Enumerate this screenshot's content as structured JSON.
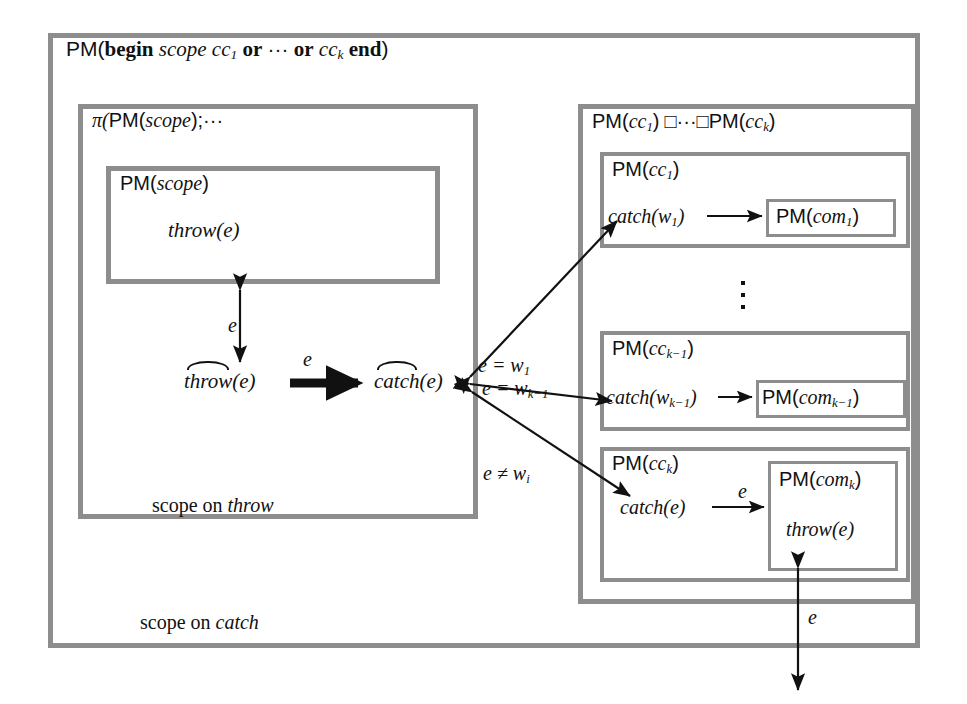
{
  "figure": {
    "kind": "nested-box process-algebra diagram",
    "title_outer": "PM(begin scope cc_1 or ... or cc_k end)",
    "colors": {
      "box_border": "#8d8d8d",
      "arrow": "#111111",
      "background": "#ffffff"
    }
  },
  "outer": {
    "label_prefix": "PM(",
    "label_begin": "begin",
    "label_scope": "scope",
    "label_cc1": "cc",
    "label_cc1_sub": "1",
    "label_or1": "or",
    "label_dots": "···",
    "label_or2": "or",
    "label_cck": "cc",
    "label_cck_sub": "k",
    "label_end": "end",
    "label_suffix": ")",
    "footer": "scope on ",
    "footer_em": "catch"
  },
  "left_panel": {
    "title_pi": "π(",
    "title_pm": "PM(",
    "title_scope": "scope",
    "title_tail": ");···",
    "footer": "scope on ",
    "footer_em": "throw",
    "inner_box": {
      "title_pm": "PM(",
      "title_scope": "scope",
      "title_close": ")",
      "body_fn": "throw",
      "body_arg": "(e)"
    },
    "hat_throw": {
      "fn": "throw",
      "arg": "(e)"
    },
    "hat_catch": {
      "fn": "catch",
      "arg": "(e)"
    }
  },
  "right_panel": {
    "title_pm1": "PM(",
    "title_cc1": "cc",
    "title_cc1_sub": "1",
    "title_box_op": "□",
    "title_dots": "···",
    "title_box_op2": "□",
    "title_pm2": "PM(",
    "title_cck": "cc",
    "title_cck_sub": "k",
    "title_close": ")",
    "vertical_ellipsis": "⋮",
    "clauses": [
      {
        "header_pm": "PM(",
        "header_cc": "cc",
        "header_sub": "1",
        "header_close": ")",
        "catch_fn": "catch",
        "catch_open": "(w",
        "catch_sub": "1",
        "catch_close": ")",
        "target_pm": "PM(",
        "target_com": "com",
        "target_sub": "1",
        "target_close": ")",
        "edge_label": ""
      },
      {
        "header_pm": "PM(",
        "header_cc": "cc",
        "header_sub": "k−1",
        "header_close": ")",
        "catch_fn": "catch",
        "catch_open": "(w",
        "catch_sub": "k−1",
        "catch_close": ")",
        "target_pm": "PM(",
        "target_com": "com",
        "target_sub": "k−1",
        "target_close": ")",
        "edge_label": ""
      },
      {
        "header_pm": "PM(",
        "header_cc": "cc",
        "header_sub": "k",
        "header_close": ")",
        "catch_fn": "catch",
        "catch_open": "(e",
        "catch_sub": "",
        "catch_close": ")",
        "target_pm": "PM(",
        "target_com": "com",
        "target_sub": "k",
        "target_close": ")",
        "edge_label": "e",
        "target_body_fn": "throw",
        "target_body_arg": "(e)"
      }
    ]
  },
  "edge_labels": {
    "e_vertical_left": "e",
    "e_bold_center": "e",
    "e_eq_w1": "e = w",
    "e_eq_w1_sub": "1",
    "e_eq_wk1": "e = w",
    "e_eq_wk1_sub": "k−1",
    "e_neq_wi": "e ≠ w",
    "e_neq_wi_sub": "i",
    "e_inner_k": "e",
    "e_bottom_out": "e"
  }
}
